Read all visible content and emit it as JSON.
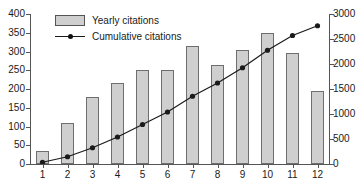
{
  "chart_data": {
    "type": "bar",
    "title": "",
    "xlabel": "",
    "ylabel": "",
    "categories": [
      "1",
      "2",
      "3",
      "4",
      "5",
      "6",
      "7",
      "8",
      "9",
      "10",
      "11",
      "12"
    ],
    "grid": false,
    "legend_position": "top-left",
    "axes": {
      "left": {
        "label": "",
        "ylim": [
          0,
          400
        ],
        "ticks": [
          0,
          50,
          100,
          150,
          200,
          250,
          300,
          350,
          400
        ],
        "tick_labels": [
          "0",
          "50",
          "100",
          "150",
          "200",
          "250",
          "300",
          "350",
          "400"
        ]
      },
      "right": {
        "label": "",
        "ylim": [
          0,
          3000
        ],
        "ticks": [
          0,
          500,
          1000,
          1500,
          2000,
          2500,
          3000
        ],
        "tick_labels": [
          "0",
          "500",
          "1000",
          "1500",
          "2000",
          "2500",
          "3000"
        ]
      },
      "x": {
        "tick_labels": [
          "1",
          "2",
          "3",
          "4",
          "5",
          "6",
          "7",
          "8",
          "9",
          "10",
          "11",
          "12"
        ]
      }
    },
    "series": [
      {
        "name": "Yearly citations",
        "type": "bar",
        "axis": "left",
        "color": "#cfcfcf",
        "edge_color": "#6e6e6e",
        "values": [
          35,
          110,
          180,
          215,
          250,
          250,
          315,
          265,
          305,
          350,
          295,
          195
        ]
      },
      {
        "name": "Cumulative citations",
        "type": "line",
        "axis": "right",
        "color": "#1a1a1a",
        "marker": "circle",
        "values": [
          35,
          145,
          325,
          540,
          790,
          1040,
          1355,
          1620,
          1925,
          2275,
          2570,
          2765
        ]
      }
    ]
  },
  "legend": {
    "items": [
      {
        "label": "Yearly citations",
        "marker": "bar-swatch"
      },
      {
        "label": "Cumulative citations",
        "marker": "line-with-dot"
      }
    ]
  }
}
